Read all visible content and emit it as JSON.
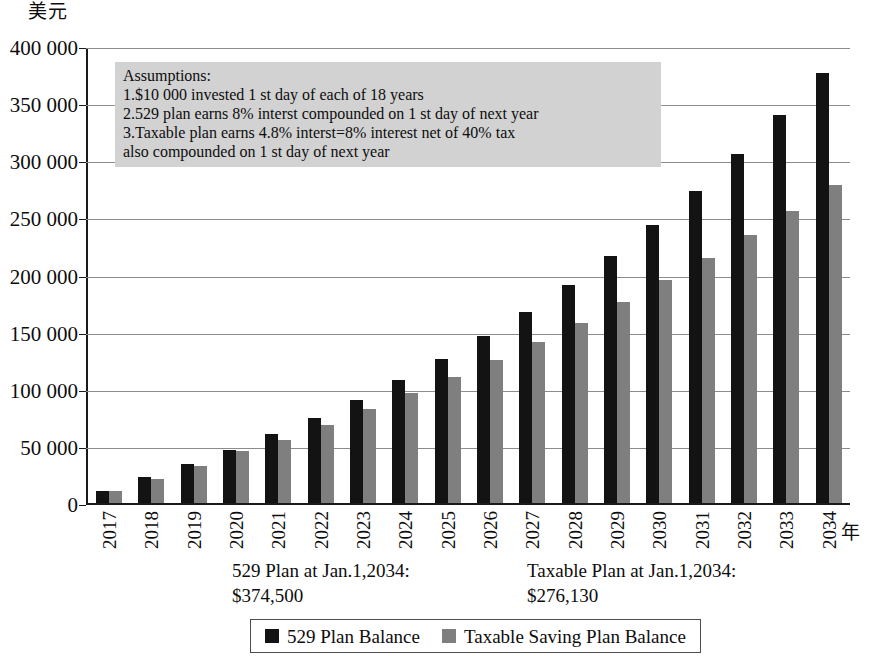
{
  "chart_data": {
    "type": "bar",
    "title": "",
    "ylabel": "美元",
    "xlabel": "年",
    "ylim": [
      0,
      400000
    ],
    "ytick_labels": [
      "400 000",
      "350 000",
      "300 000",
      "250 000",
      "200 000",
      "150 000",
      "100 000",
      "50 000",
      "0"
    ],
    "ytick_values": [
      400000,
      350000,
      300000,
      250000,
      200000,
      150000,
      100000,
      50000,
      0
    ],
    "grid": true,
    "legend_position": "bottom",
    "categories": [
      "2017",
      "2018",
      "2019",
      "2020",
      "2021",
      "2022",
      "2023",
      "2024",
      "2025",
      "2026",
      "2027",
      "2028",
      "2029",
      "2030",
      "2031",
      "2032",
      "2033",
      "2034"
    ],
    "series": [
      {
        "name": "529 Plan Balance",
        "color": "#131313",
        "values": [
          10800,
          22400,
          34000,
          46000,
          60000,
          74500,
          90500,
          107500,
          126000,
          146000,
          167500,
          191000,
          216500,
          243500,
          273000,
          305500,
          339500,
          376000
        ]
      },
      {
        "name": "Taxable Saving Plan Balance",
        "color": "#7f7f7f",
        "values": [
          10480,
          21000,
          32000,
          45500,
          55500,
          68500,
          82500,
          96500,
          110500,
          125500,
          141000,
          157500,
          176000,
          195500,
          214500,
          234500,
          255500,
          278000
        ]
      }
    ],
    "annotations": [
      "529 Plan at Jan.1,2034:",
      "$374,500",
      "Taxable Plan at Jan.1,2034:",
      "$276,130"
    ]
  },
  "assumptions": {
    "lines": [
      "Assumptions:",
      "1.$10 000 invested 1 st day of each of 18 years",
      "2.529 plan earns 8% interst compounded on 1 st day of next year",
      "3.Taxable plan earns 4.8% interst=8% interest net of 40% tax",
      "also compounded on 1 st day of next year"
    ]
  },
  "summary": {
    "left_title": "529 Plan at Jan.1,2034:",
    "left_value": "$374,500",
    "right_title": "Taxable Plan at Jan.1,2034:",
    "right_value": "$276,130"
  },
  "legend": {
    "entries": [
      {
        "label": "529 Plan Balance",
        "color": "#131313"
      },
      {
        "label": "Taxable Saving Plan Balance",
        "color": "#7f7f7f"
      }
    ]
  }
}
